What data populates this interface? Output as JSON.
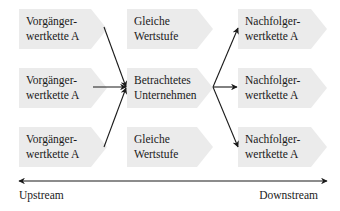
{
  "diagram": {
    "colors": {
      "box_fill": "#ebebeb",
      "line": "#1a1a1a",
      "text": "#1a1a1a"
    },
    "left_column": [
      {
        "line1": "Vorgänger-",
        "line2": "wertkette A"
      },
      {
        "line1": "Vorgänger-",
        "line2": "wertkette A"
      },
      {
        "line1": "Vorgänger-",
        "line2": "wertkette A"
      }
    ],
    "middle_column": [
      {
        "line1": "Gleiche",
        "line2": "Wertstufe"
      },
      {
        "line1": "Betrachtetes",
        "line2": "Unternehmen"
      },
      {
        "line1": "Gleiche",
        "line2": "Wertstufe"
      }
    ],
    "right_column": [
      {
        "line1": "Nachfolger-",
        "line2": "wertkette A"
      },
      {
        "line1": "Nachfolger-",
        "line2": "wertkette A"
      },
      {
        "line1": "Nachfolger-",
        "line2": "wertkette A"
      }
    ],
    "axis": {
      "left_label": "Upstream",
      "right_label": "Downstream"
    }
  }
}
